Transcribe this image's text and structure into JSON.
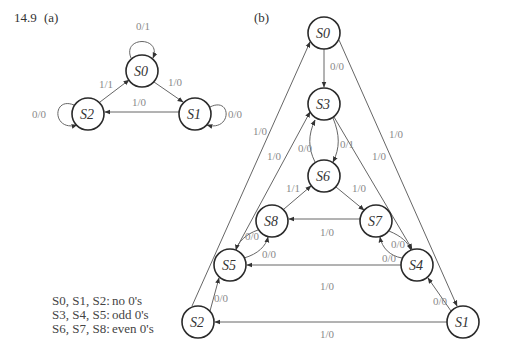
{
  "problem_number": "14.9",
  "part_a": {
    "label": "(a)",
    "nodes": [
      {
        "id": "S0",
        "text": "S0",
        "x": 142,
        "y": 71
      },
      {
        "id": "S1",
        "text": "S1",
        "x": 195,
        "y": 114
      },
      {
        "id": "S2",
        "text": "S2",
        "x": 88,
        "y": 114
      }
    ],
    "edges": [
      {
        "from": "S0",
        "to": "S0",
        "label": "0/1"
      },
      {
        "from": "S0",
        "to": "S1",
        "label": "1/0"
      },
      {
        "from": "S1",
        "to": "S1",
        "label": "0/0"
      },
      {
        "from": "S1",
        "to": "S2",
        "label": "1/0"
      },
      {
        "from": "S2",
        "to": "S2",
        "label": "0/0"
      },
      {
        "from": "S2",
        "to": "S0",
        "label": "1/1"
      }
    ]
  },
  "part_b": {
    "label": "(b)",
    "nodes": [
      {
        "id": "S0",
        "text": "S0",
        "x": 324,
        "y": 33
      },
      {
        "id": "S3",
        "text": "S3",
        "x": 324,
        "y": 104
      },
      {
        "id": "S6",
        "text": "S6",
        "x": 324,
        "y": 176
      },
      {
        "id": "S8",
        "text": "S8",
        "x": 272,
        "y": 221
      },
      {
        "id": "S7",
        "text": "S7",
        "x": 376,
        "y": 221
      },
      {
        "id": "S5",
        "text": "S5",
        "x": 230,
        "y": 265
      },
      {
        "id": "S4",
        "text": "S4",
        "x": 417,
        "y": 265
      },
      {
        "id": "S2",
        "text": "S2",
        "x": 198,
        "y": 322
      },
      {
        "id": "S1",
        "text": "S1",
        "x": 463,
        "y": 322
      }
    ],
    "edges": [
      {
        "from": "S0",
        "to": "S3",
        "label": "0/0"
      },
      {
        "from": "S0",
        "to": "S1",
        "label": "1/0"
      },
      {
        "from": "S1",
        "to": "S2",
        "label": "1/0"
      },
      {
        "from": "S2",
        "to": "S0",
        "label": "1/0"
      },
      {
        "from": "S1",
        "to": "S4",
        "label": "0/0"
      },
      {
        "from": "S2",
        "to": "S5",
        "label": "0/0"
      },
      {
        "from": "S3",
        "to": "S4",
        "label": "1/0"
      },
      {
        "from": "S4",
        "to": "S5",
        "label": "1/0"
      },
      {
        "from": "S5",
        "to": "S3",
        "label": "1/0"
      },
      {
        "from": "S3",
        "to": "S6",
        "label": "0/1"
      },
      {
        "from": "S6",
        "to": "S3",
        "label": "0/0"
      },
      {
        "from": "S4",
        "to": "S7",
        "label": "0/0"
      },
      {
        "from": "S7",
        "to": "S4",
        "label": "0/0"
      },
      {
        "from": "S5",
        "to": "S8",
        "label": "0/0"
      },
      {
        "from": "S8",
        "to": "S5",
        "label": "0/0"
      },
      {
        "from": "S6",
        "to": "S7",
        "label": "1/0"
      },
      {
        "from": "S7",
        "to": "S8",
        "label": "1/0"
      },
      {
        "from": "S8",
        "to": "S6",
        "label": "1/1"
      }
    ]
  },
  "legend": [
    {
      "states": "S0, S1, S2:",
      "meaning": "no 0's"
    },
    {
      "states": "S3, S4, S5:",
      "meaning": "odd 0's"
    },
    {
      "states": "S6, S7, S8:",
      "meaning": "even 0's"
    }
  ]
}
